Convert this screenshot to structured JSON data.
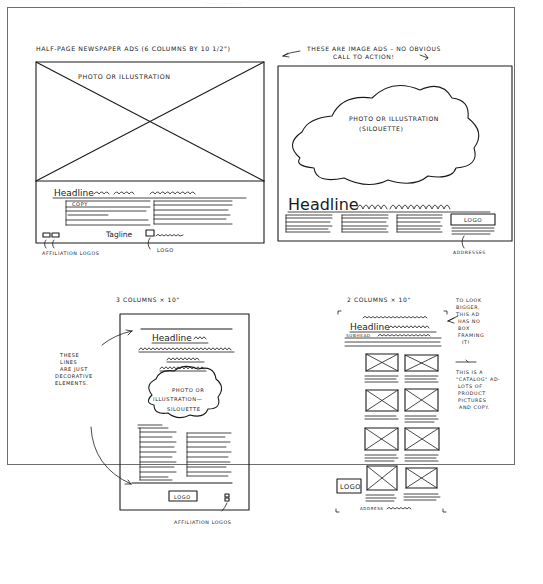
{
  "sheet": {
    "title": "Half-page newspaper ad sketches",
    "top_caption": "HALF-PAGE NEWSPAPER ADS (6 COLUMNS BY 10 1/2\")",
    "top_note_line1": "THESE ARE IMAGE ADS – NO OBVIOUS",
    "top_note_line2": "CALL TO ACTION!"
  },
  "ad1": {
    "photo_label": "PHOTO OR ILLUSTRATION",
    "headline": "Headline",
    "copy_label": "COPY",
    "tagline": "Tagline",
    "callout_affiliation": "AFFILIATION LOGOS",
    "callout_logo": "LOGO"
  },
  "ad2": {
    "photo_label_line1": "PHOTO OR ILLUSTRATION",
    "photo_label_line2": "(SILOUETTE)",
    "headline": "Headline",
    "logo_label": "LOGO",
    "callout_address": "ADDRESSES"
  },
  "ad3": {
    "size_label": "3 COLUMNS × 10\"",
    "headline": "Headline",
    "photo_label_line1": "PHOTO OR",
    "photo_label_line2": "ILLUSTRATION—",
    "photo_label_line3": "SILOUETTE",
    "logo_label": "LOGO",
    "callout_affiliation": "AFFILIATION LOGOS",
    "note_lines": [
      "THESE",
      "LINES",
      "ARE JUST",
      "DECORATIVE",
      "ELEMENTS."
    ]
  },
  "ad4": {
    "size_label": "2 COLUMNS × 10\"",
    "headline": "Headline",
    "subhead": "SUBHEAD",
    "logo_label": "LOGO",
    "address_label": "ADDRESS",
    "note1_lines": [
      "TO LOOK",
      "BIGGER,",
      "THIS AD",
      "HAS NO",
      "BOX",
      "FRAMING",
      "IT!"
    ],
    "note2_lines": [
      "THIS IS A",
      "\"CATALOG\" AD-",
      "LOTS OF",
      "PRODUCT",
      "PICTURES",
      "AND COPY."
    ]
  }
}
